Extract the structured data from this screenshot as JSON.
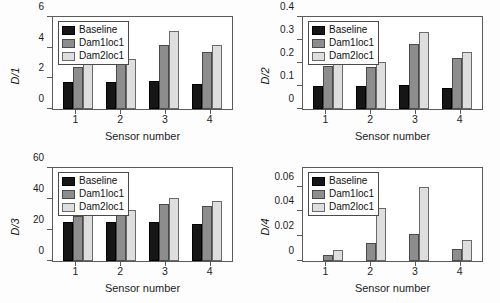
{
  "figure": {
    "series_names": [
      "Baseline",
      "Dam1loc1",
      "Dam2loc1"
    ],
    "series_colors": [
      "#161616",
      "#8d8d8d",
      "#dedede"
    ],
    "xlabel": "Sensor number",
    "categories": [
      "1",
      "2",
      "3",
      "4"
    ]
  },
  "chart_data": [
    {
      "type": "bar",
      "title": "",
      "ylabel": "D/1",
      "xlabel": "Sensor number",
      "categories": [
        "1",
        "2",
        "3",
        "4"
      ],
      "ylim": [
        0,
        6
      ],
      "yticks": [
        0,
        2,
        4,
        6
      ],
      "ytick_labels": [
        "0",
        "2",
        "4",
        "6"
      ],
      "grid": false,
      "legend": [
        "Baseline",
        "Dam1loc1",
        "Dam2loc1"
      ],
      "legend_position": "upper left",
      "series": [
        {
          "name": "Baseline",
          "values": [
            1.75,
            1.78,
            1.82,
            1.65
          ]
        },
        {
          "name": "Dam1loc1",
          "values": [
            2.72,
            2.92,
            4.2,
            3.72
          ]
        },
        {
          "name": "Dam2loc1",
          "values": [
            3.15,
            3.25,
            5.08,
            4.2
          ]
        }
      ]
    },
    {
      "type": "bar",
      "title": "",
      "ylabel": "D/2",
      "xlabel": "Sensor number",
      "categories": [
        "1",
        "2",
        "3",
        "4"
      ],
      "ylim": [
        0,
        0.4
      ],
      "yticks": [
        0,
        0.1,
        0.2,
        0.3,
        0.4
      ],
      "ytick_labels": [
        "0",
        "0.1",
        "0.2",
        "0.3",
        "0.4"
      ],
      "grid": false,
      "legend": [
        "Baseline",
        "Dam1loc1",
        "Dam2loc1"
      ],
      "legend_position": "upper left",
      "series": [
        {
          "name": "Baseline",
          "values": [
            0.098,
            0.1,
            0.103,
            0.09
          ]
        },
        {
          "name": "Dam1loc1",
          "values": [
            0.188,
            0.181,
            0.281,
            0.221
          ]
        },
        {
          "name": "Dam2loc1",
          "values": [
            0.209,
            0.204,
            0.334,
            0.246
          ]
        }
      ]
    },
    {
      "type": "bar",
      "title": "",
      "ylabel": "D/3",
      "xlabel": "Sensor number",
      "categories": [
        "1",
        "2",
        "3",
        "4"
      ],
      "ylim": [
        0,
        60
      ],
      "yticks": [
        0,
        20,
        40,
        60
      ],
      "ytick_labels": [
        "0",
        "20",
        "40",
        "60"
      ],
      "grid": false,
      "legend": [
        "Baseline",
        "Dam1loc1",
        "Dam2loc1"
      ],
      "legend_position": "upper left",
      "series": [
        {
          "name": "Baseline",
          "values": [
            25.0,
            25.3,
            25.3,
            24.0
          ]
        },
        {
          "name": "Dam1loc1",
          "values": [
            29.2,
            31.3,
            37.0,
            35.5
          ]
        },
        {
          "name": "Dam2loc1",
          "values": [
            31.8,
            33.0,
            40.6,
            38.5
          ]
        }
      ]
    },
    {
      "type": "bar",
      "title": "",
      "ylabel": "D/4",
      "xlabel": "Sensor number",
      "categories": [
        "1",
        "2",
        "3",
        "4"
      ],
      "ylim": [
        0,
        0.075
      ],
      "yticks": [
        0,
        0.02,
        0.04,
        0.06
      ],
      "ytick_labels": [
        "0",
        "0.02",
        "0.04",
        "0.06"
      ],
      "grid": false,
      "legend": [
        "Baseline",
        "Dam1loc1",
        "Dam2loc1"
      ],
      "legend_position": "upper left",
      "series": [
        {
          "name": "Baseline",
          "values": [
            0,
            0,
            0,
            0
          ]
        },
        {
          "name": "Dam1loc1",
          "values": [
            0.0045,
            0.0142,
            0.0215,
            0.0093
          ]
        },
        {
          "name": "Dam2loc1",
          "values": [
            0.0088,
            0.0425,
            0.0598,
            0.0168
          ]
        }
      ]
    }
  ]
}
